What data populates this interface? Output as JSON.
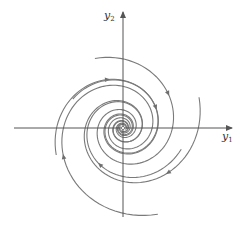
{
  "diagram": {
    "type": "phase-portrait",
    "colors": {
      "axis": "#555555",
      "trajectory": "#7a7a7a",
      "arrow": "#6e6e6e",
      "label": "#333333"
    },
    "origin": {
      "x": 123,
      "y": 128
    },
    "axes": {
      "horizontal": {
        "x1": 14,
        "x2": 232,
        "label_base": "y",
        "label_sub": "1"
      },
      "vertical": {
        "y1": 217,
        "y2": 12,
        "label_base": "y",
        "label_sub": "2"
      }
    },
    "spiral": {
      "direction": "clockwise",
      "behavior": "converging",
      "arms": [
        {
          "start_angle_deg": -112,
          "start_radius": 75,
          "end_radius": 3,
          "arrow_at": 0.09
        },
        {
          "start_angle_deg": -22,
          "start_radius": 82,
          "end_radius": 3,
          "arrow_at": 0.08
        },
        {
          "start_angle_deg": 68,
          "start_radius": 93,
          "end_radius": 3,
          "arrow_at": 0.1
        },
        {
          "start_angle_deg": 158,
          "start_radius": 72,
          "end_radius": 3,
          "arrow_at": 0.11
        },
        {
          "start_angle_deg": -150,
          "start_radius": 58,
          "end_radius": 3,
          "arrow_at": 0.14
        },
        {
          "start_angle_deg": 20,
          "start_radius": 62,
          "end_radius": 3,
          "arrow_at": 0.12
        }
      ],
      "turns": 2.4
    }
  }
}
